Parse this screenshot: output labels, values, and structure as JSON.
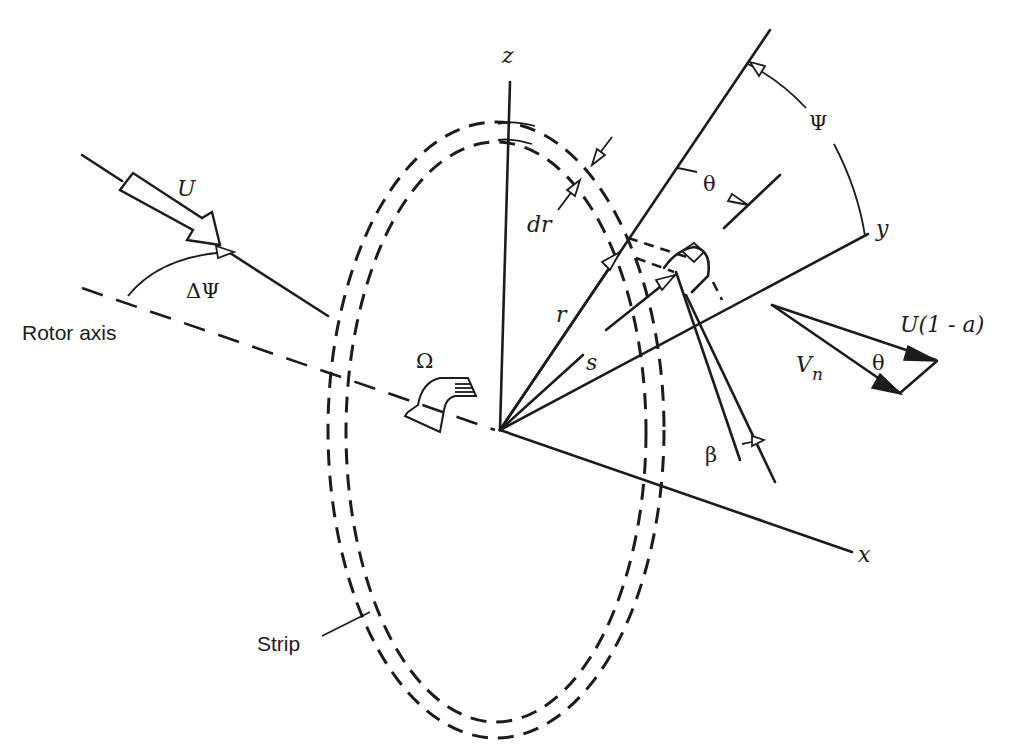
{
  "diagram": {
    "type": "rotor blade-element geometry",
    "labels": {
      "z_axis": "z",
      "y_axis": "y",
      "x_axis": "x",
      "wind_speed": "U",
      "yaw_angle": "ΔΨ",
      "rotor_axis": "Rotor axis",
      "rotation": "Ω",
      "strip_width": "dr",
      "radius": "r",
      "span_position": "s",
      "azimuth": "Ψ",
      "pitch_angle": "θ",
      "cone_angle": "β",
      "axial_velocity": "U(1 - a)",
      "normal_velocity_symbol": "V",
      "normal_velocity_subscript": "n",
      "triangle_angle": "θ",
      "strip": "Strip"
    },
    "colors": {
      "ink": "#1c1c1c",
      "background": "#ffffff"
    }
  }
}
